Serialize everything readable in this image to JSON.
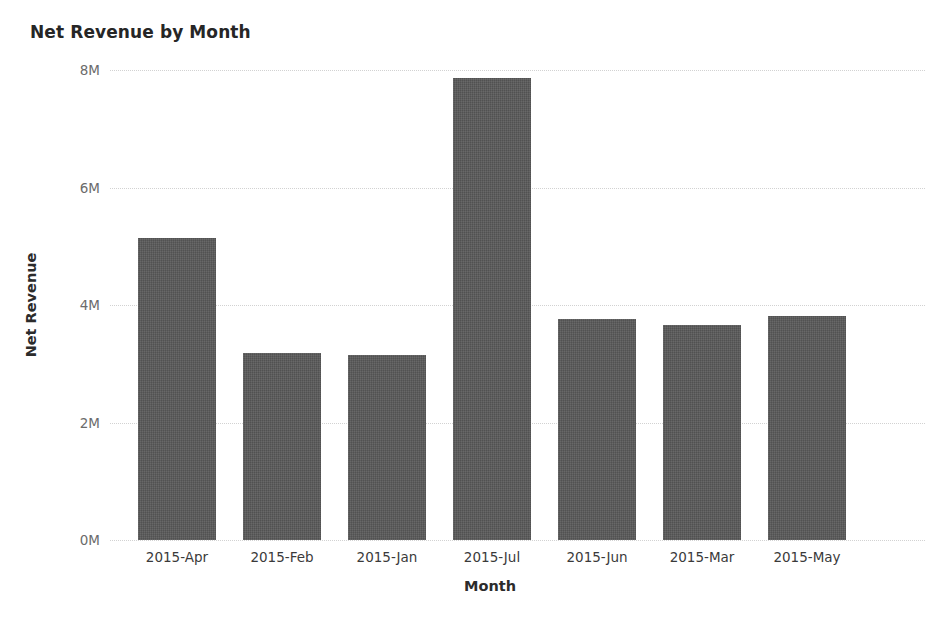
{
  "chart_data": {
    "type": "bar",
    "title": "Net Revenue by Month",
    "xlabel": "Month",
    "ylabel": "Net Revenue",
    "categories": [
      "2015-Apr",
      "2015-Feb",
      "2015-Jan",
      "2015-Jul",
      "2015-Jun",
      "2015-Mar",
      "2015-May"
    ],
    "values": [
      5140000,
      3180000,
      3150000,
      7860000,
      3760000,
      3660000,
      3810000
    ],
    "ylim": [
      0,
      8000000
    ],
    "yticks": [
      0,
      2000000,
      4000000,
      6000000,
      8000000
    ],
    "ytick_labels": [
      "0M",
      "2M",
      "4M",
      "6M",
      "8M"
    ],
    "grid": true,
    "grid_axis": "y",
    "grid_style": "dotted",
    "legend": false,
    "bar_color": "#595959",
    "background_color": "#ffffff"
  }
}
